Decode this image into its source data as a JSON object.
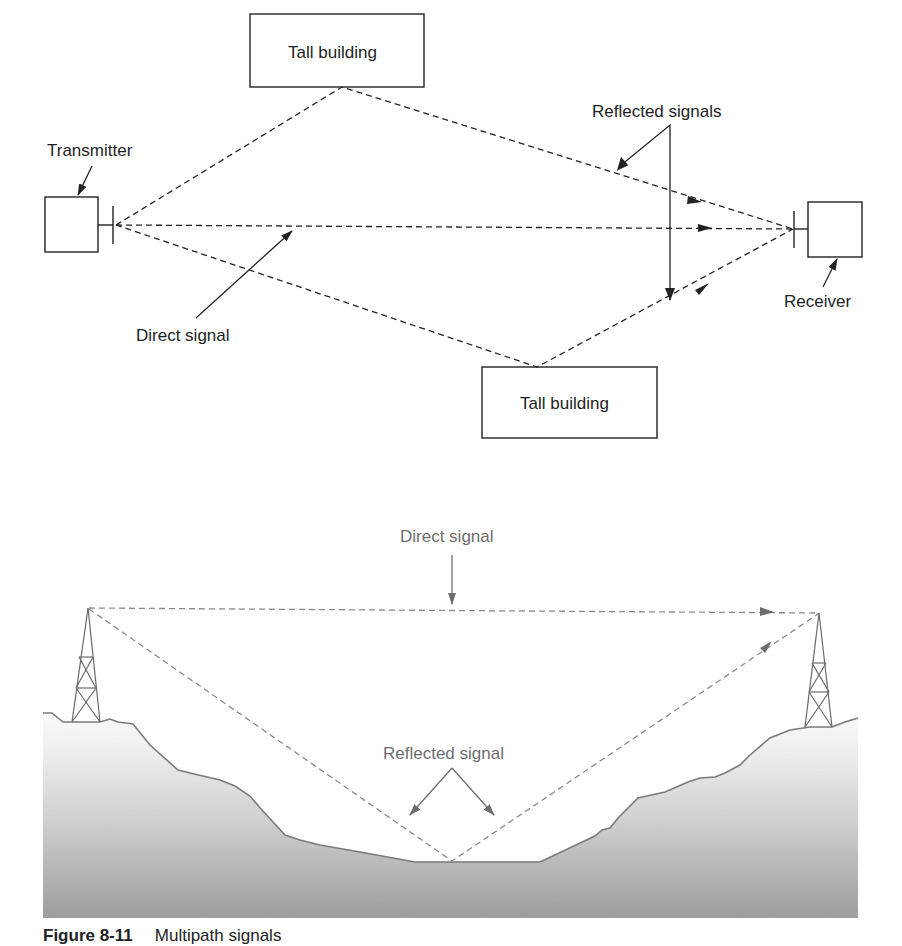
{
  "diagram_top": {
    "title": "Multipath in urban environment",
    "labels": {
      "building_top": "Tall building",
      "building_bottom": "Tall building",
      "transmitter": "Transmitter",
      "receiver": "Receiver",
      "direct": "Direct signal",
      "reflected": "Reflected signals"
    },
    "nodes": {
      "transmitter_box": {
        "x": 45,
        "y": 197,
        "w": 53,
        "h": 55
      },
      "receiver_box": {
        "x": 808,
        "y": 202,
        "w": 54,
        "h": 55
      },
      "building_top_box": {
        "x": 250,
        "y": 14,
        "w": 174,
        "h": 73
      },
      "building_bottom_box": {
        "x": 482,
        "y": 367,
        "w": 175,
        "h": 71
      }
    }
  },
  "diagram_bottom": {
    "title": "Multipath over terrain",
    "labels": {
      "direct": "Direct signal",
      "reflected": "Reflected signal"
    },
    "colors": {
      "line": "#7a7a7a",
      "ground_top": "#f2f2f2",
      "ground_bottom": "#9c9c9c"
    }
  },
  "caption": {
    "figure_number": "Figure 8-11",
    "text": "Multipath signals"
  }
}
